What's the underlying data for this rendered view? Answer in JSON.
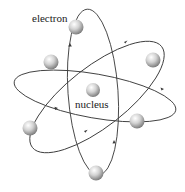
{
  "diagram": {
    "labels": {
      "electron": "electron",
      "nucleus": "nucleus"
    },
    "colors": {
      "orbit": "#3a3a3a",
      "sphere_light": "#ffffff",
      "sphere_mid": "#c8c8c8",
      "sphere_dark": "#6e6e6e",
      "text": "#1a1a1a"
    },
    "orbit_count": 3,
    "electron_count": 6
  }
}
